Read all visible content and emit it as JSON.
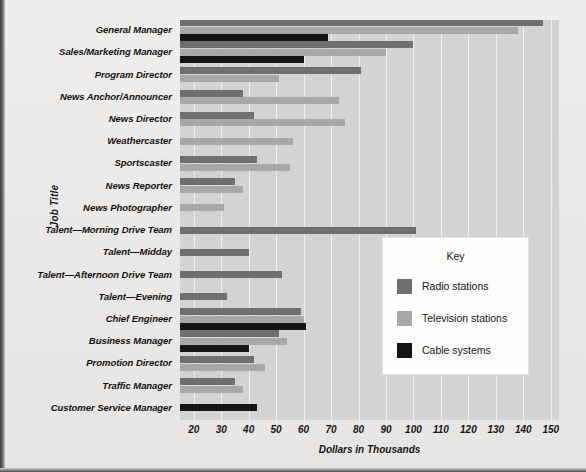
{
  "chart_data": {
    "type": "bar",
    "orientation": "horizontal",
    "title": "",
    "xlabel": "Dollars in Thousands",
    "ylabel": "Job Title",
    "xlim": [
      15,
      153
    ],
    "xticks": [
      20,
      30,
      40,
      50,
      60,
      70,
      80,
      90,
      100,
      110,
      120,
      130,
      140,
      150
    ],
    "grid": true,
    "legend_position": "inside-right",
    "categories": [
      "General Manager",
      "Sales/Marketing Manager",
      "Program Director",
      "News Anchor/Announcer",
      "News Director",
      "Weathercaster",
      "Sportscaster",
      "News Reporter",
      "News Photographer",
      "Talent—Morning Drive Team",
      "Talent—Midday",
      "Talent—Afternoon Drive Team",
      "Talent—Evening",
      "Chief Engineer",
      "Business Manager",
      "Promotion Director",
      "Traffic Manager",
      "Customer Service Manager"
    ],
    "series": [
      {
        "name": "Radio stations",
        "color": "#6f6f6f",
        "values": [
          147,
          100,
          81,
          38,
          42,
          null,
          43,
          35,
          null,
          101,
          40,
          52,
          32,
          59,
          51,
          42,
          35,
          null
        ]
      },
      {
        "name": "Television stations",
        "color": "#a8a8a6",
        "values": [
          138,
          90,
          51,
          73,
          75,
          56,
          55,
          38,
          31,
          null,
          null,
          null,
          null,
          60,
          54,
          46,
          38,
          null
        ]
      },
      {
        "name": "Cable systems",
        "color": "#151515",
        "values": [
          69,
          60,
          null,
          null,
          null,
          null,
          null,
          null,
          null,
          null,
          null,
          null,
          null,
          61,
          40,
          null,
          null,
          43
        ]
      }
    ]
  },
  "legend": {
    "title": "Key",
    "entries": [
      {
        "label": "Radio stations",
        "color": "#6f6f6f"
      },
      {
        "label": "Television stations",
        "color": "#a8a8a6"
      },
      {
        "label": "Cable systems",
        "color": "#151515"
      }
    ]
  }
}
